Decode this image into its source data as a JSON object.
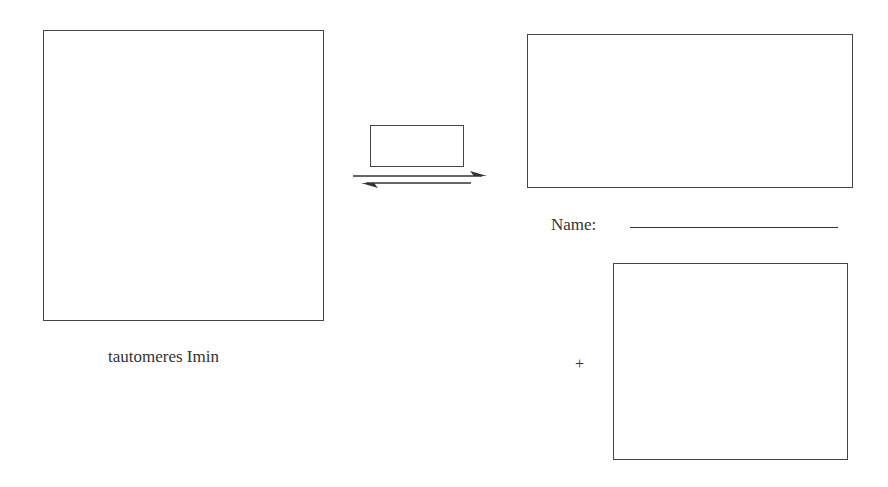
{
  "diagram": {
    "reactant": {
      "caption": "tautomeres Imin"
    },
    "reagent_box": {
      "content": ""
    },
    "product_top": {
      "content": ""
    },
    "name_field": {
      "label": "Name:",
      "value": ""
    },
    "product_bottom": {
      "prefix": "+",
      "content": ""
    },
    "arrow": {
      "type": "equilibrium"
    }
  }
}
